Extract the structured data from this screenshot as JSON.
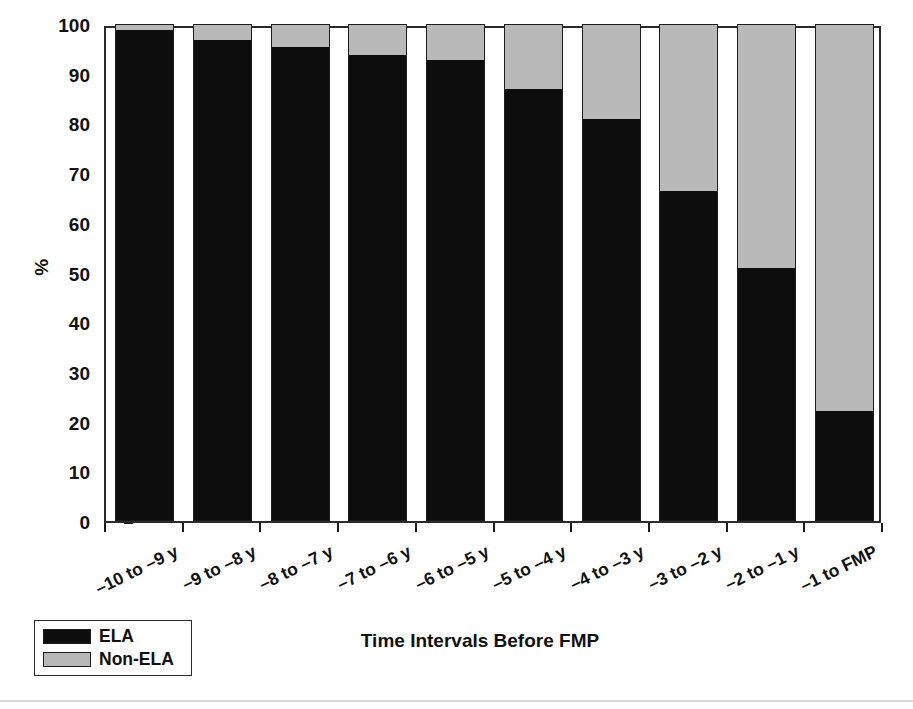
{
  "chart_data": {
    "type": "bar",
    "subtype": "stacked-100-percent",
    "title": "",
    "xlabel": "Time Intervals Before FMP",
    "ylabel": "%",
    "ylim": [
      0,
      100
    ],
    "yticks": [
      0,
      10,
      20,
      30,
      40,
      50,
      60,
      70,
      80,
      90,
      100
    ],
    "ytick_labels": [
      "0",
      "10",
      "20",
      "30",
      "40",
      "50",
      "60",
      "70",
      "80",
      "90",
      "100"
    ],
    "grid": false,
    "legend_position": "bottom-left",
    "categories": [
      "–10 to –9 y",
      "–9 to –8 y",
      "–8 to –7 y",
      "–7 to –6 y",
      "–6 to –5 y",
      "–5 to –4 y",
      "–4 to –3 y",
      "–3 to –2 y",
      "–2 to –1 y",
      "–1 to FMP"
    ],
    "series": [
      {
        "name": "ELA",
        "color": "#0d0d0d",
        "values": [
          99,
          97,
          95.5,
          94,
          93,
          87,
          81,
          66.5,
          51,
          22
        ]
      },
      {
        "name": "Non-ELA",
        "color": "#b9b9b9",
        "values": [
          1,
          3,
          4.5,
          6,
          7,
          13,
          19,
          33.5,
          49,
          78
        ]
      }
    ],
    "bar_totals": [
      100,
      100,
      100,
      100,
      100,
      100,
      100,
      100,
      100,
      100
    ]
  },
  "axes": {
    "y_title": "%",
    "x_title": "Time Intervals Before FMP",
    "frame_color": "#2b2b2b"
  },
  "legend": {
    "entries": [
      {
        "label": "ELA",
        "color": "#0d0d0d"
      },
      {
        "label": "Non-ELA",
        "color": "#b9b9b9"
      }
    ]
  }
}
